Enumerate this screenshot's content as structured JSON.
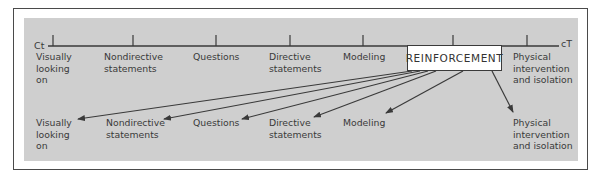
{
  "diagram": {
    "axis": {
      "start_label": "Ct",
      "end_label": "cT"
    },
    "continuum": [
      {
        "id": "visually",
        "label": "Visually\nlooking\non"
      },
      {
        "id": "nondirective",
        "label": "Nondirective\nstatements"
      },
      {
        "id": "questions",
        "label": "Questions"
      },
      {
        "id": "directive",
        "label": "Directive\nstatements"
      },
      {
        "id": "modeling",
        "label": "Modeling"
      },
      {
        "id": "reinforcement",
        "label": "REINFORCEMENT"
      },
      {
        "id": "physical",
        "label": "Physical\nintervention\nand isolation"
      }
    ],
    "targets": [
      {
        "id": "visually",
        "label": "Visually\nlooking\non"
      },
      {
        "id": "nondirective",
        "label": "Nondirective\nstatements"
      },
      {
        "id": "questions",
        "label": "Questions"
      },
      {
        "id": "directive",
        "label": "Directive\nstatements"
      },
      {
        "id": "modeling",
        "label": "Modeling"
      },
      {
        "id": "physical",
        "label": "Physical\nintervention\nand isolation"
      }
    ],
    "colors": {
      "panel": "#cfcfcf",
      "line": "#3a3a3a",
      "text": "#3a3a3a",
      "box": "#ffffff"
    }
  }
}
